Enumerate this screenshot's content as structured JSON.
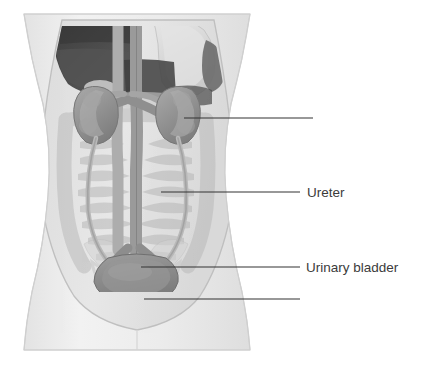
{
  "figure": {
    "type": "anatomical-diagram",
    "background_color": "#ffffff",
    "label_color": "#3b3b3b",
    "leader_line_color": "#333333",
    "body_outline_color": "#c9c9c9",
    "labels": [
      {
        "id": "kidney",
        "text": "",
        "text_x": 318,
        "text_y": 123,
        "leader": {
          "x1": 184,
          "y1": 118,
          "x2": 313,
          "y2": 118
        }
      },
      {
        "id": "ureter",
        "text": "Ureter",
        "text_x": 307,
        "text_y": 197,
        "leader": {
          "x1": 161,
          "y1": 192,
          "x2": 300,
          "y2": 192
        }
      },
      {
        "id": "urinary-bladder",
        "text": "Urinary bladder",
        "text_x": 306,
        "text_y": 272,
        "leader": {
          "x1": 141,
          "y1": 267,
          "x2": 300,
          "y2": 267
        }
      },
      {
        "id": "urethra",
        "text": "",
        "text_x": 306,
        "text_y": 304,
        "leader": {
          "x1": 144,
          "y1": 299,
          "x2": 300,
          "y2": 299
        }
      }
    ],
    "structures": [
      {
        "name": "torso-silhouette",
        "color": "#ededed"
      },
      {
        "name": "abdominal-cavity",
        "color": "#e0e0e0"
      },
      {
        "name": "liver",
        "color": "#4a4a4a"
      },
      {
        "name": "stomach",
        "color": "#dcdcdc"
      },
      {
        "name": "spleen",
        "color": "#6e6e6e"
      },
      {
        "name": "large-intestine",
        "color": "#cfcfcf"
      },
      {
        "name": "small-intestine",
        "color": "#c4c4c4"
      },
      {
        "name": "kidney-left",
        "color": "#9a9a9a"
      },
      {
        "name": "kidney-right",
        "color": "#9a9a9a"
      },
      {
        "name": "aorta",
        "color": "#8d8d8d"
      },
      {
        "name": "inferior-vena-cava",
        "color": "#a8a8a8"
      },
      {
        "name": "ureter-left",
        "color": "#b4b4b4"
      },
      {
        "name": "ureter-right",
        "color": "#b4b4b4"
      },
      {
        "name": "urinary-bladder",
        "color": "#8f8f8f"
      },
      {
        "name": "urethra",
        "color": "#9d9d9d"
      },
      {
        "name": "pelvis-bone",
        "color": "#d6d6d6"
      }
    ]
  }
}
